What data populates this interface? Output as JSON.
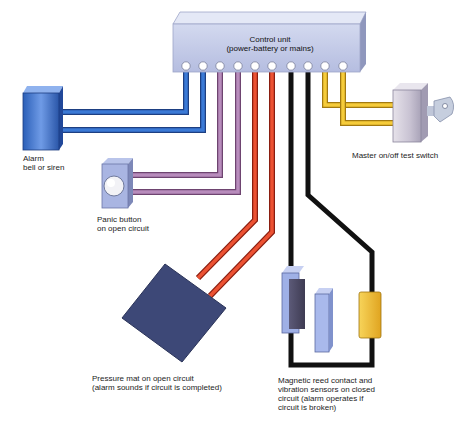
{
  "diagram": {
    "type": "burglar alarm wiring diagram",
    "control_unit": {
      "label": "Control unit\n(power-battery or mains)",
      "terminal_count": 10
    },
    "components": [
      {
        "id": "alarm",
        "label": "Alarm\nbell or siren",
        "wire_color": "blue"
      },
      {
        "id": "panic",
        "label": "Panic button\non open circuit",
        "wire_color": "purple"
      },
      {
        "id": "mat",
        "label": "Pressure mat on open circuit\n(alarm sounds if circuit is completed)",
        "wire_color": "red"
      },
      {
        "id": "sensors",
        "label": "Magnetic reed contact and\nvibration sensors on closed\ncircuit (alarm operates if\ncircuit is broken)",
        "wire_color": "black"
      },
      {
        "id": "switch",
        "label": "Master on/off test switch",
        "wire_color": "yellow"
      }
    ],
    "colors": {
      "blue": "#2f6fc8",
      "purple": "#a77aab",
      "red": "#e2462a",
      "black": "#111111",
      "yellow": "#f2c531",
      "unit": "#c4cce8",
      "mat": "#3e4a78"
    }
  }
}
